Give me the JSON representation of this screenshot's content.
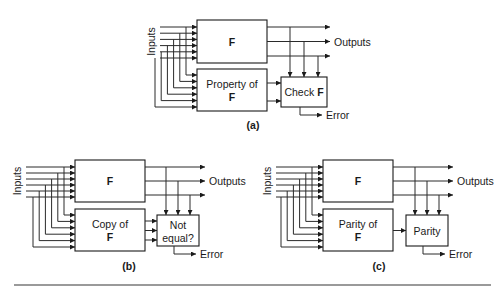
{
  "figure": {
    "panels": [
      {
        "id": "a",
        "caption": "(a)",
        "inputs_label": "Inputs",
        "outputs_label": "Outputs",
        "error_label": "Error",
        "f_box": {
          "label": "F",
          "x": 197,
          "y": 20,
          "w": 70,
          "h": 43
        },
        "side_box": {
          "label_line1": "Property of",
          "label_line2": "F",
          "x": 197,
          "y": 69,
          "w": 70,
          "h": 42
        },
        "check_box": {
          "label": "Check ",
          "label_bold": "F",
          "x": 281,
          "y": 77,
          "w": 46,
          "h": 30
        },
        "side_outputs": 2,
        "inputs_x": 160,
        "output_end_x": 330,
        "caption_xy": [
          253,
          129
        ]
      },
      {
        "id": "b",
        "caption": "(b)",
        "inputs_label": "Inputs",
        "outputs_label": "Outputs",
        "error_label": "Error",
        "f_box": {
          "label": "F",
          "x": 75,
          "y": 160,
          "w": 70,
          "h": 42
        },
        "side_box": {
          "label_line1": "Copy of",
          "label_line2": "F",
          "x": 75,
          "y": 209,
          "w": 70,
          "h": 42
        },
        "check_box": {
          "label_line1": "Not",
          "label_line2": "equal?",
          "x": 157,
          "y": 215,
          "w": 42,
          "h": 31
        },
        "side_outputs": 3,
        "inputs_x": 26,
        "output_end_x": 205,
        "caption_xy": [
          129,
          270
        ]
      },
      {
        "id": "c",
        "caption": "(c)",
        "inputs_label": "Inputs",
        "outputs_label": "Outputs",
        "error_label": "Error",
        "f_box": {
          "label": "F",
          "x": 323,
          "y": 160,
          "w": 70,
          "h": 42
        },
        "side_box": {
          "label_line1": "Parity of",
          "label_line2": "F",
          "x": 323,
          "y": 209,
          "w": 70,
          "h": 42
        },
        "check_box": {
          "label": "Parity",
          "x": 406,
          "y": 215,
          "w": 42,
          "h": 31
        },
        "side_outputs": 1,
        "inputs_x": 276,
        "output_end_x": 453,
        "caption_xy": [
          379,
          270
        ]
      }
    ],
    "bottom_rule": {
      "y": 285,
      "x1": 14,
      "x2": 491,
      "color": "#9a9a9a"
    }
  }
}
